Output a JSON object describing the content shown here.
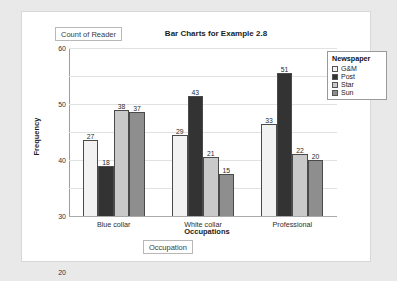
{
  "buttons": {
    "count_of_reader": "Count of Reader",
    "occupation": "Occupation"
  },
  "legend": {
    "title": "Newspaper"
  },
  "colors": {
    "gm": "#f2f2f2",
    "post": "#333333",
    "star": "#c9c9c9",
    "sun": "#8e8e8e",
    "gridline": "#e2e2e2",
    "axis": "#9e9e9e",
    "page_background": "#e9e9e9",
    "card_background": "#ffffff"
  },
  "chart_data": {
    "type": "bar",
    "title": "Bar Charts for Example 2.8",
    "xlabel": "Occupations",
    "ylabel": "Frequency",
    "categories": [
      "Blue collar",
      "White collar",
      "Professional"
    ],
    "yticks": [
      0,
      10,
      20,
      30,
      40,
      50,
      60
    ],
    "ylim": [
      0,
      60
    ],
    "grid": true,
    "legend_position": "top-right",
    "series": [
      {
        "name": "G&M",
        "color": "#f2f2f2",
        "values": [
          27,
          29,
          33
        ]
      },
      {
        "name": "Post",
        "color": "#333333",
        "values": [
          18,
          43,
          51
        ]
      },
      {
        "name": "Star",
        "color": "#c9c9c9",
        "values": [
          38,
          21,
          22
        ]
      },
      {
        "name": "Sun",
        "color": "#8e8e8e",
        "values": [
          37,
          15,
          20
        ]
      }
    ]
  }
}
